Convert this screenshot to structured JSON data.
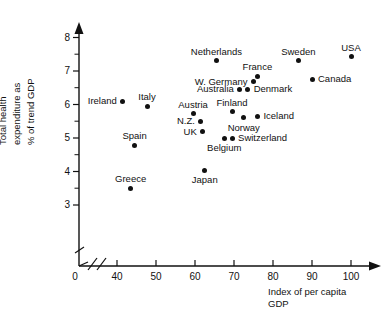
{
  "chart_data": {
    "type": "scatter",
    "title": "",
    "xlabel": "Index of per capita GDP",
    "xlabel_lines": [
      "Index of per capita",
      "GDP"
    ],
    "ylabel": "Total health expenditure as % of trend GDP",
    "ylabel_lines": [
      "Total health",
      "expenditure as",
      "% of trend GDP"
    ],
    "xlim": [
      38,
      106
    ],
    "ylim": [
      3.0,
      8.3
    ],
    "x_axis_break": true,
    "y_axis_break": true,
    "origin_label": "0",
    "grid": false,
    "legend": "none",
    "xticks": [
      40,
      50,
      60,
      70,
      80,
      90,
      100
    ],
    "xtick_labels": [
      "40",
      "50",
      "60",
      "70",
      "80",
      "90",
      "100"
    ],
    "yticks": [
      3,
      4,
      5,
      6,
      7,
      8
    ],
    "ytick_labels": [
      "3",
      "4",
      "5",
      "6",
      "7",
      "8"
    ],
    "yticks_minor": [
      3.5,
      4.5,
      5.5,
      6.5,
      7.5
    ],
    "points": [
      {
        "label": "Ireland",
        "x": 41.5,
        "y": 6.1,
        "label_pos": "left"
      },
      {
        "label": "Italy",
        "x": 47.7,
        "y": 5.95,
        "label_pos": "above"
      },
      {
        "label": "Spain",
        "x": 44.5,
        "y": 4.78,
        "label_pos": "above"
      },
      {
        "label": "Greece",
        "x": 43.5,
        "y": 3.5,
        "label_pos": "above"
      },
      {
        "label": "Austria",
        "x": 59.5,
        "y": 5.72,
        "label_pos": "above"
      },
      {
        "label": "N.Z.",
        "x": 61.5,
        "y": 5.5,
        "label_pos": "left"
      },
      {
        "label": "UK",
        "x": 62.0,
        "y": 5.18,
        "label_pos": "left"
      },
      {
        "label": "Japan",
        "x": 62.5,
        "y": 4.03,
        "label_pos": "below"
      },
      {
        "label": "Belgium",
        "x": 67.5,
        "y": 5.0,
        "label_pos": "below"
      },
      {
        "label": "Switzerland",
        "x": 69.5,
        "y": 5.0,
        "label_pos": "right"
      },
      {
        "label": "Netherlands",
        "x": 65.5,
        "y": 7.3,
        "label_pos": "above"
      },
      {
        "label": "Finland",
        "x": 69.5,
        "y": 5.78,
        "label_pos": "above"
      },
      {
        "label": "Norway",
        "x": 72.5,
        "y": 5.6,
        "label_pos": "below"
      },
      {
        "label": "Iceland",
        "x": 76.0,
        "y": 5.65,
        "label_pos": "right"
      },
      {
        "label": "Australia",
        "x": 71.5,
        "y": 6.45,
        "label_pos": "left"
      },
      {
        "label": "Denmark",
        "x": 73.5,
        "y": 6.45,
        "label_pos": "right"
      },
      {
        "label": "W. Germany",
        "x": 75.0,
        "y": 6.68,
        "label_pos": "left"
      },
      {
        "label": "France",
        "x": 76.0,
        "y": 6.85,
        "label_pos": "above"
      },
      {
        "label": "Sweden",
        "x": 86.5,
        "y": 7.3,
        "label_pos": "above"
      },
      {
        "label": "Canada",
        "x": 90.0,
        "y": 6.75,
        "label_pos": "right"
      },
      {
        "label": "USA",
        "x": 100.0,
        "y": 7.42,
        "label_pos": "above"
      }
    ]
  }
}
